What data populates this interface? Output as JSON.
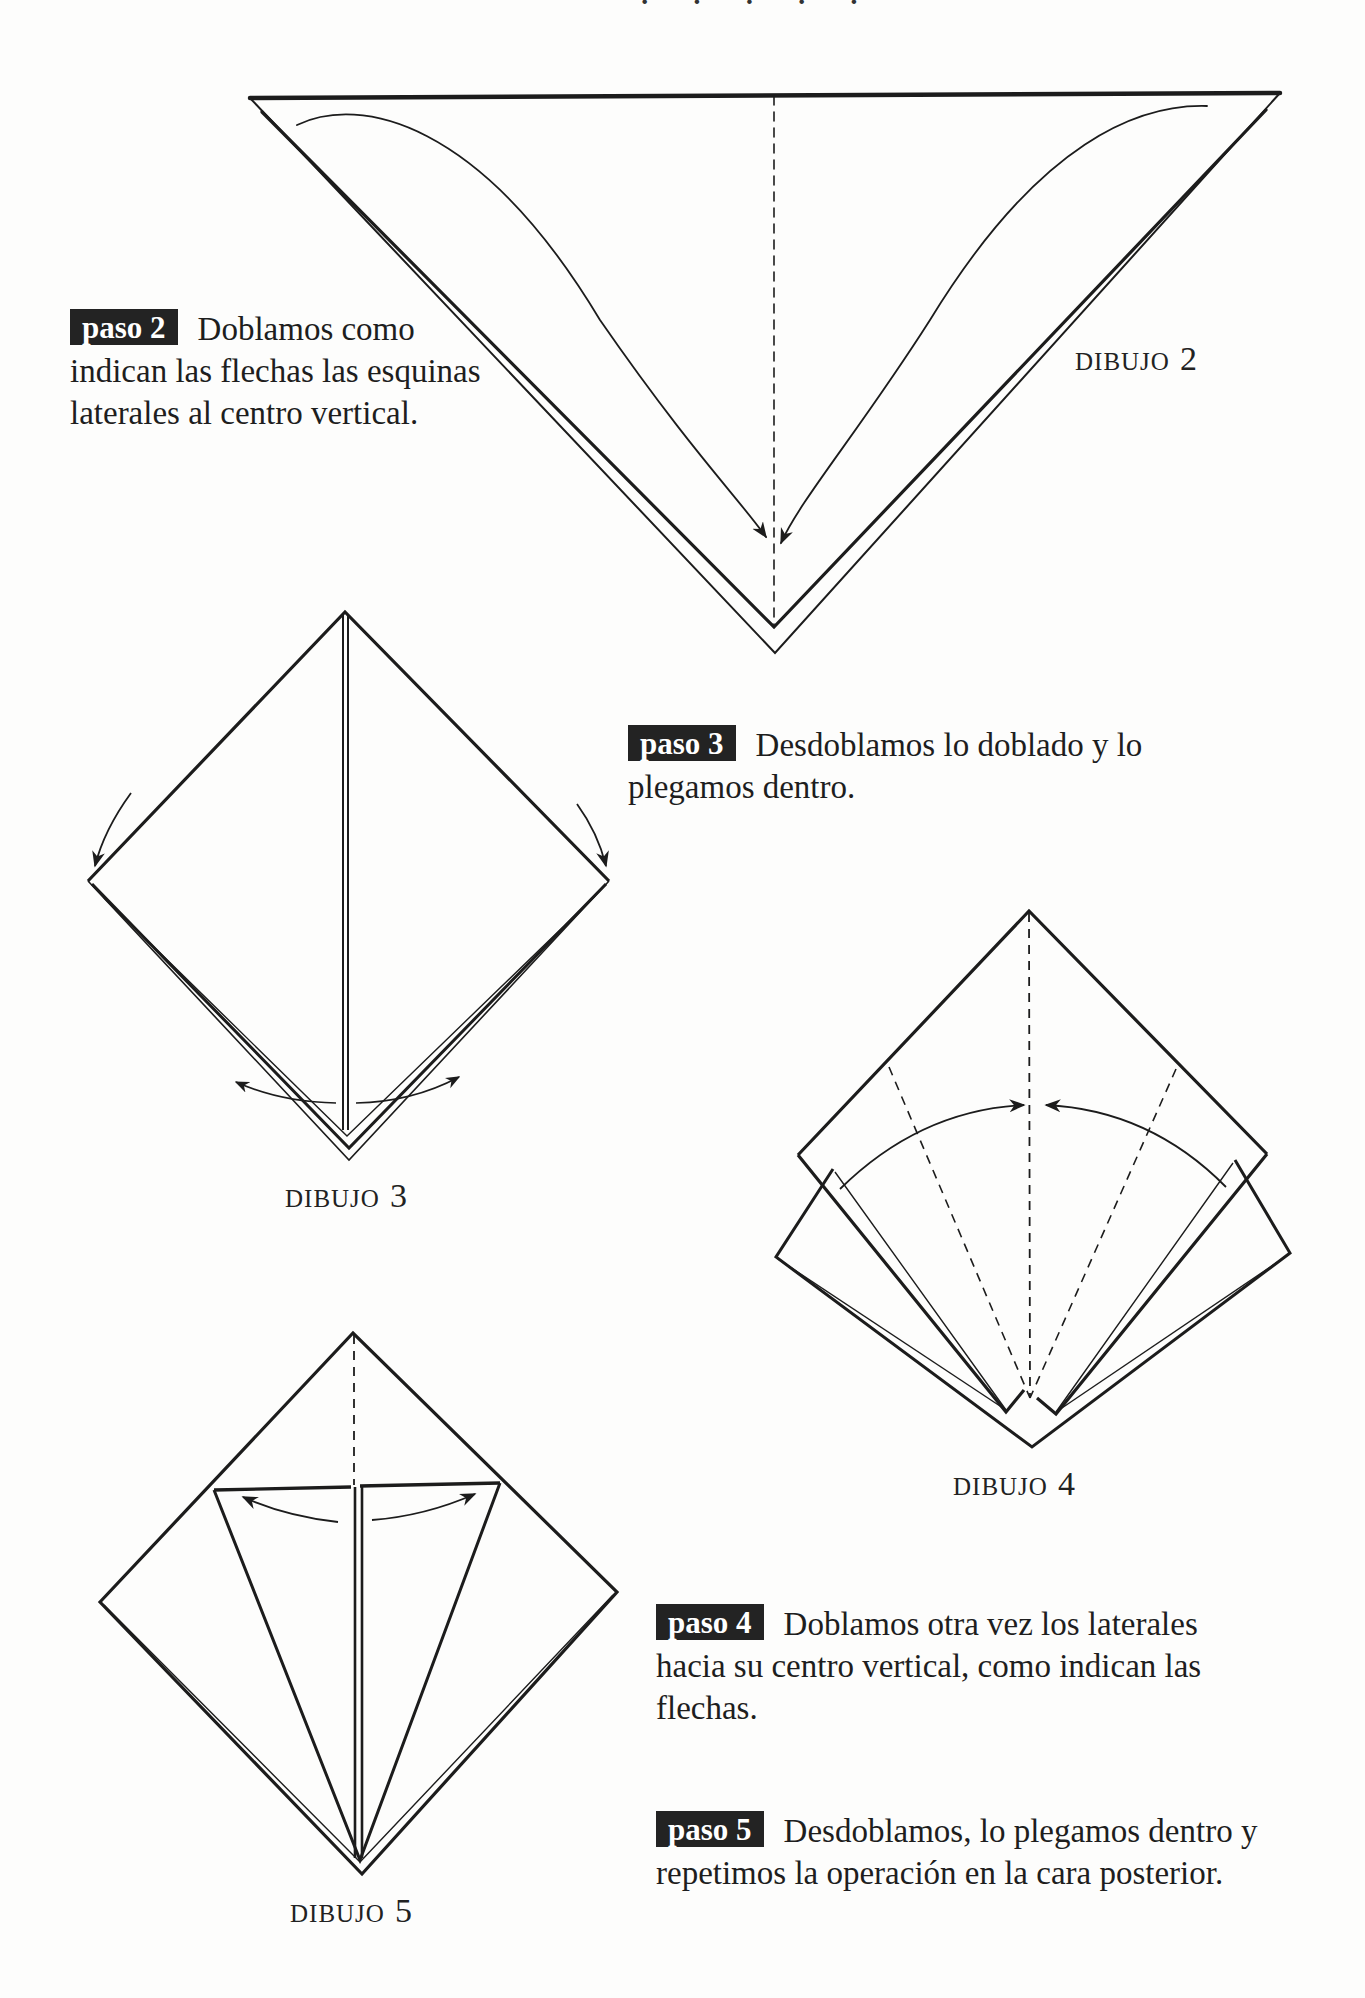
{
  "page": {
    "header_fragment": "· · · · ·"
  },
  "steps": [
    {
      "badge": "paso 2",
      "lines": [
        "Doblamos como",
        "indican las flechas las esquinas",
        "laterales al centro vertical."
      ]
    },
    {
      "badge": "paso 3",
      "lines": [
        "Desdoblamos lo doblado y lo",
        "plegamos dentro."
      ]
    },
    {
      "badge": "paso 4",
      "lines": [
        "Doblamos otra vez los laterales",
        "hacia su centro vertical, como indican las",
        "flechas."
      ]
    },
    {
      "badge": "paso 5",
      "lines": [
        "Desdoblamos, lo plegamos dentro y",
        "repetimos la operación en la cara posterior."
      ]
    }
  ],
  "figures": [
    {
      "label": "DIBUJO",
      "number": "2"
    },
    {
      "label": "DIBUJO",
      "number": "3"
    },
    {
      "label": "DIBUJO",
      "number": "4"
    },
    {
      "label": "DIBUJO",
      "number": "5"
    }
  ],
  "colors": {
    "ink": "#1c1c1c",
    "badge_bg": "#232323",
    "badge_text": "#ffffff",
    "paper": "#fdfdfc"
  }
}
